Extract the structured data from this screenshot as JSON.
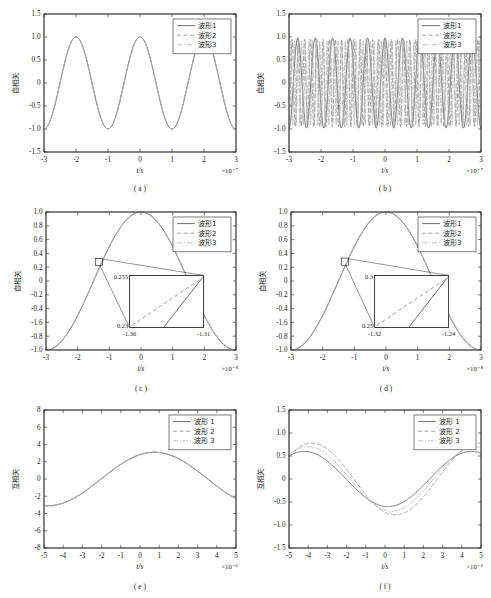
{
  "figure": {
    "name": "six-panel-correlation-figure",
    "panels_order": [
      "a",
      "b",
      "c",
      "d",
      "e",
      "f"
    ]
  },
  "common": {
    "xlabel": "t/s",
    "autocorr_ylabel": "自相关",
    "crosscorr_ylabel": "互相关",
    "legend_labels_nospace": [
      "波形1",
      "波形2",
      "波形3"
    ],
    "legend_labels_space": [
      "波形 1",
      "波形 2",
      "波形 3"
    ],
    "series_colors": [
      "#555555",
      "#8d8d8d",
      "#b4b4b4"
    ],
    "series_dashes": [
      "none",
      "dashed",
      "dashdot"
    ]
  },
  "chart_data": [
    {
      "id": "a",
      "type": "line",
      "sublabel": "( a )",
      "title": "",
      "xlabel": "t/s",
      "ylabel": "自相关",
      "x_exponent": "×10⁻⁷",
      "xlim": [
        -3,
        3
      ],
      "ylim": [
        -1.5,
        1.5
      ],
      "xticks": [
        -3,
        -2,
        -1,
        0,
        1,
        2,
        3
      ],
      "yticks": [
        -1.5,
        -1.0,
        -0.5,
        0,
        0.5,
        1.0,
        1.5
      ],
      "xticklabels": [
        "-3",
        "-2",
        "-1",
        "0",
        "1",
        "2",
        "3"
      ],
      "yticklabels": [
        "-1.5",
        "-1.0",
        "-0.5",
        "0",
        "0.5",
        "1.0",
        "1.5"
      ],
      "grid": false,
      "legend": {
        "position": "upper-right",
        "entries": [
          "波形1",
          "波形2",
          "波形3"
        ]
      },
      "series": [
        {
          "name": "波形1",
          "style": "solid",
          "form": "cosine",
          "amplitude": 1.0,
          "cycles": 3.0,
          "phase": 0.0
        },
        {
          "name": "波形2",
          "style": "dashed",
          "form": "cosine",
          "amplitude": 1.0,
          "cycles": 3.0,
          "phase": 0.0
        },
        {
          "name": "波形3",
          "style": "dashdot",
          "form": "cosine",
          "amplitude": 1.0,
          "cycles": 3.0,
          "phase": 0.0
        }
      ],
      "note": "three coincident cosine autocorrelations, 3 cycles over the window"
    },
    {
      "id": "b",
      "type": "line",
      "sublabel": "( b )",
      "title": "",
      "xlabel": "t/s",
      "ylabel": "自相关",
      "x_exponent": "×10⁻⁷",
      "xlim": [
        -3,
        3
      ],
      "ylim": [
        -1.5,
        1.5
      ],
      "xticks": [
        -3,
        -2,
        -1,
        0,
        1,
        2,
        3
      ],
      "yticks": [
        -1.5,
        -1.0,
        -0.5,
        0,
        0.5,
        1.0,
        1.5
      ],
      "xticklabels": [
        "-3",
        "-2",
        "-1",
        "0",
        "1",
        "2",
        "3"
      ],
      "yticklabels": [
        "-1.5",
        "-1.0",
        "-0.5",
        "0",
        "0.5",
        "1.0",
        "1.5"
      ],
      "grid": false,
      "legend": {
        "position": "upper-right",
        "entries": [
          "波形1",
          "波形2",
          "波形3"
        ]
      },
      "series": [
        {
          "name": "波形1",
          "style": "solid",
          "form": "cosine",
          "amplitude": 0.98,
          "cycles": 11.0,
          "phase": 0.0
        },
        {
          "name": "波形2",
          "style": "dashed",
          "form": "cosine",
          "amplitude": 0.95,
          "cycles": 31.0,
          "phase": 0.0
        },
        {
          "name": "波形3",
          "style": "dashdot",
          "form": "cosine",
          "amplitude": 0.92,
          "cycles": 53.0,
          "phase": 0.0
        }
      ],
      "note": "high-frequency dense autocorrelation oscillations"
    },
    {
      "id": "c",
      "type": "line",
      "sublabel": "( c )",
      "title": "",
      "xlabel": "t/s",
      "ylabel": "自相关",
      "x_exponent": "×10⁻⁸",
      "xlim": [
        -3,
        3
      ],
      "ylim": [
        -1.0,
        1.0
      ],
      "xticks": [
        -3,
        -2,
        -1,
        0,
        1,
        2,
        3
      ],
      "yticks": [
        -1.0,
        -0.8,
        -0.6,
        -0.4,
        -0.2,
        0,
        0.2,
        0.4,
        0.6,
        0.8,
        1.0
      ],
      "xticklabels": [
        "-3",
        "-2",
        "-1",
        "0",
        "1",
        "2",
        "3"
      ],
      "yticklabels": [
        "-1.0",
        "-0.8",
        "-1.6",
        "-0.4",
        "-0.2",
        "0",
        "0.2",
        "0.4",
        "0.6",
        "0.8",
        "1.0"
      ],
      "grid": false,
      "legend": {
        "position": "upper-right",
        "entries": [
          "波形1",
          "波形2",
          "波形3"
        ]
      },
      "series": [
        {
          "name": "波形1",
          "style": "solid",
          "form": "cosine",
          "amplitude": 1.0,
          "cycles": 1.0,
          "phase": 0.0
        },
        {
          "name": "波形2",
          "style": "dashed",
          "form": "cosine",
          "amplitude": 1.0,
          "cycles": 1.0,
          "phase": 0.0
        },
        {
          "name": "波形3",
          "style": "dashdot",
          "form": "cosine",
          "amplitude": 1.0,
          "cycles": 1.0,
          "phase": 0.0
        }
      ],
      "inset": {
        "marker_x": -1.33,
        "marker_y": 0.275,
        "x_range": [
          -1.36,
          -1.31
        ],
        "y_range": [
          0.23,
          0.255
        ],
        "xticklabels": [
          "-1.36",
          "-1.31"
        ],
        "yticklabels": [
          "0.23",
          "0.255"
        ]
      },
      "note": "single-cycle cosine with magnified inset on rising edge"
    },
    {
      "id": "d",
      "type": "line",
      "sublabel": "( d )",
      "title": "",
      "xlabel": "t/s",
      "ylabel": "自相关",
      "x_exponent": "×10⁻⁸",
      "xlim": [
        -3,
        3
      ],
      "ylim": [
        -1.0,
        1.0
      ],
      "xticks": [
        -3,
        -2,
        -1,
        0,
        1,
        2,
        3
      ],
      "yticks": [
        -1.0,
        -0.8,
        -0.6,
        -0.4,
        -0.2,
        0,
        0.2,
        0.4,
        0.6,
        0.8,
        1.0
      ],
      "xticklabels": [
        "-3",
        "-2",
        "-1",
        "0",
        "1",
        "2",
        "3"
      ],
      "yticklabels": [
        "-1.0",
        "-0.8",
        "-1.6",
        "-0.4",
        "-0.2",
        "0",
        "0.2",
        "0.4",
        "0.6",
        "0.8",
        "1.0"
      ],
      "grid": false,
      "legend": {
        "position": "upper-right",
        "entries": [
          "波形1",
          "波形2",
          "波形3"
        ]
      },
      "series": [
        {
          "name": "波形1",
          "style": "solid",
          "form": "cosine",
          "amplitude": 1.0,
          "cycles": 1.0,
          "phase": 0.0
        },
        {
          "name": "波形2",
          "style": "dashed",
          "form": "cosine",
          "amplitude": 1.0,
          "cycles": 1.0,
          "phase": 0.0
        },
        {
          "name": "波形3",
          "style": "dashdot",
          "form": "cosine",
          "amplitude": 1.0,
          "cycles": 1.0,
          "phase": 0.0
        }
      ],
      "inset": {
        "marker_x": -1.3,
        "marker_y": 0.28,
        "x_range": [
          -1.32,
          -1.24
        ],
        "y_range": [
          0.25,
          0.3
        ],
        "xticklabels": [
          "-1.32",
          "-1.24"
        ],
        "yticklabels": [
          "0.25",
          "0.3"
        ]
      },
      "note": "single-cycle cosine with magnified inset, wider zoom window than (c)"
    },
    {
      "id": "e",
      "type": "line",
      "sublabel": "( e )",
      "title": "",
      "xlabel": "t/s",
      "ylabel": "互相关",
      "x_exponent": "×10⁻⁶",
      "xlim": [
        -5,
        5
      ],
      "ylim": [
        -8,
        8
      ],
      "xticks": [
        -5,
        -4,
        -3,
        -2,
        -1,
        0,
        1,
        2,
        3,
        4,
        5
      ],
      "yticks": [
        -8,
        -6,
        -4,
        -2,
        0,
        2,
        4,
        6,
        8
      ],
      "xticklabels": [
        "-5",
        "-4",
        "-3",
        "-2",
        "-1",
        "0",
        "1",
        "2",
        "3",
        "4",
        "5"
      ],
      "yticklabels": [
        "-8",
        "-6",
        "-4",
        "-2",
        "0",
        "2",
        "4",
        "6",
        "8"
      ],
      "grid": false,
      "legend": {
        "position": "upper-right",
        "entries": [
          "波形 1",
          "波形 2",
          "波形 3"
        ]
      },
      "series": [
        {
          "name": "波形 1",
          "style": "solid",
          "form": "cosine",
          "amplitude": 3.1,
          "cycles": 0.9,
          "phase": -0.75
        },
        {
          "name": "波形 2",
          "style": "dashed",
          "form": "cosine",
          "amplitude": 3.1,
          "cycles": 0.9,
          "phase": -0.75
        },
        {
          "name": "波形 3",
          "style": "dashdot",
          "form": "cosine",
          "amplitude": 3.1,
          "cycles": 0.9,
          "phase": -0.75
        }
      ],
      "note": "cross-correlation, peak ≈ 3.1 near t = -0.8, trough ≈ -2.6 near t = 3.9"
    },
    {
      "id": "f",
      "type": "line",
      "sublabel": "( f )",
      "title": "",
      "xlabel": "t/s",
      "ylabel": "互相关",
      "x_exponent": "×10⁻⁶",
      "xlim": [
        -5,
        5
      ],
      "ylim": [
        -1.5,
        1.5
      ],
      "xticks": [
        -5,
        -4,
        -3,
        -2,
        -1,
        0,
        1,
        2,
        3,
        4,
        5
      ],
      "yticks": [
        -1.5,
        -1.0,
        -0.5,
        0,
        0.5,
        1.0,
        1.5
      ],
      "xticklabels": [
        "-5",
        "-4",
        "-3",
        "-2",
        "-1",
        "0",
        "1",
        "2",
        "3",
        "4",
        "5"
      ],
      "yticklabels": [
        "-1.5",
        "-1.0",
        "-0.5",
        "0",
        "0.5",
        "1.0",
        "1.5"
      ],
      "grid": false,
      "legend": {
        "position": "upper-right",
        "entries": [
          "波形 1",
          "波形 2",
          "波形 3"
        ]
      },
      "series": [
        {
          "name": "波形 1",
          "style": "solid",
          "form": "cosine",
          "amplitude": 0.6,
          "cycles": 1.15,
          "phase": 4.2
        },
        {
          "name": "波形 2",
          "style": "dashed",
          "form": "cosine",
          "amplitude": 0.78,
          "cycles": 1.15,
          "phase": 3.8
        },
        {
          "name": "波形 3",
          "style": "dashdot",
          "form": "cosine",
          "amplitude": 0.7,
          "cycles": 1.15,
          "phase": 4.0
        }
      ],
      "note": "three separated cross-correlation curves, amplitudes ≈ 0.6–0.8"
    }
  ]
}
